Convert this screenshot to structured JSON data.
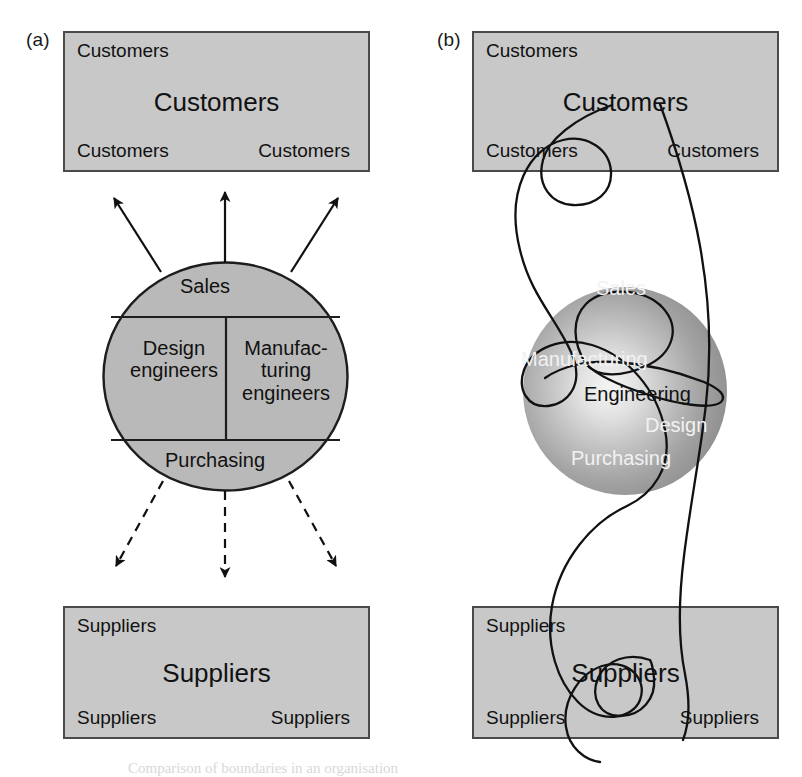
{
  "figure": {
    "caption_partial": "Comparison of boundaries in an organisation"
  },
  "panels": [
    {
      "id": "a",
      "label": "(a)",
      "top_box": {
        "name": "customers-box",
        "corner_top_left": "Customers",
        "center": "Customers",
        "corner_bottom_left": "Customers",
        "corner_bottom_right": "Customers"
      },
      "bottom_box": {
        "name": "suppliers-box",
        "corner_top_left": "Suppliers",
        "center": "Suppliers",
        "corner_bottom_left": "Suppliers",
        "corner_bottom_right": "Suppliers"
      },
      "circle": {
        "style": "flat-grey-segmented",
        "fill": "#b9b9b9",
        "stroke": "#222222",
        "segments": [
          {
            "name": "sales",
            "label": "Sales"
          },
          {
            "name": "design-engineers",
            "label": "Design\nengineers"
          },
          {
            "name": "manufacturing-engineers",
            "label": "Manufac-\nturing\nengineers"
          },
          {
            "name": "purchasing",
            "label": "Purchasing"
          }
        ]
      },
      "connectors": {
        "upper": {
          "style": "solid",
          "arrows": 3,
          "direction": "outward-up"
        },
        "lower": {
          "style": "dashed",
          "arrows": 3,
          "direction": "outward-down"
        }
      }
    },
    {
      "id": "b",
      "label": "(b)",
      "top_box": {
        "name": "customers-box",
        "corner_top_left": "Customers",
        "center": "Customers",
        "corner_bottom_left": "Customers",
        "corner_bottom_right": "Customers"
      },
      "bottom_box": {
        "name": "suppliers-box",
        "corner_top_left": "Suppliers",
        "center": "Suppliers",
        "corner_bottom_left": "Suppliers",
        "corner_bottom_right": "Suppliers"
      },
      "circle": {
        "style": "radial-gradient-sphere",
        "fill_center": "#f0f0f0",
        "fill_edge": "#8e8e8e",
        "segments": [
          {
            "name": "sales",
            "label": "Sales",
            "color": "#f2f2f2"
          },
          {
            "name": "manufacturing",
            "label": "Manufacturing",
            "color": "#f2f2f2"
          },
          {
            "name": "engineering",
            "label": "Engineering",
            "color": "#111111"
          },
          {
            "name": "design",
            "label": "Design",
            "color": "#f2f2f2"
          },
          {
            "name": "purchasing",
            "label": "Purchasing",
            "color": "#f2f2f2"
          }
        ]
      },
      "connectors": {
        "style": "free-form-curves",
        "description": "continuous looping curves passing through customers box, sphere and suppliers box"
      }
    }
  ],
  "colors": {
    "box_fill": "#c8c8c8",
    "box_border": "#4a4a4a",
    "circle_fill_a": "#b9b9b9",
    "line": "#111111"
  }
}
